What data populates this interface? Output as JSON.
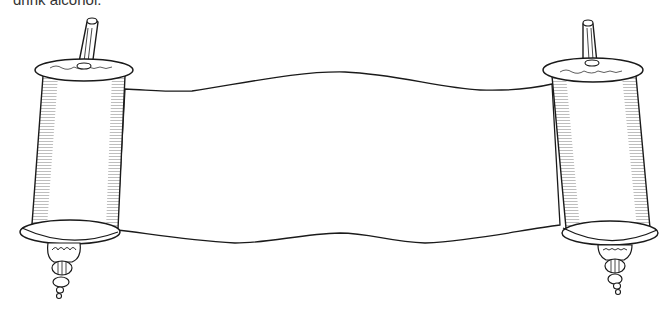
{
  "caption": {
    "text": "drink alcohol."
  },
  "illustration": {
    "subject": "blank scroll with two rollers",
    "style": "black ink line drawing",
    "colors": {
      "ink": "#1a1a1a",
      "paper": "#ffffff",
      "caption_text": "#333333"
    }
  }
}
